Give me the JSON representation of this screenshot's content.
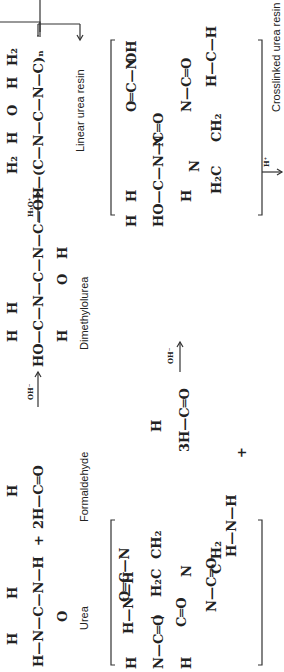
{
  "diagram": {
    "orientation": "rotated 90deg counterclockwise",
    "row1": {
      "urea": {
        "label": "Urea",
        "top": [
          "H",
          "H"
        ],
        "chain": "H—N—C—N—H",
        "bottom": "O"
      },
      "plus": "+",
      "formaldehyde": {
        "label": "Formaldehyde",
        "top": "H",
        "chain": "2H—C═O"
      },
      "arrow1_condition": "OH⁻",
      "dimethylolurea": {
        "label": "Dimethylolurea",
        "top": [
          "H",
          "H"
        ],
        "chain": "HO—C—N—C—N—C—OH",
        "bottom": [
          "H",
          "O",
          "H",
          "H"
        ]
      },
      "arrow2_condition": "H₃O⁺",
      "linear_resin": {
        "label": "Linear urea resin",
        "top": [
          "H₂",
          "H",
          "O",
          "H",
          "H₂"
        ],
        "chain": "—(C—N—C—N—C)ₙ"
      }
    },
    "row2": {
      "reactant_cyclic": {
        "pieces": [
          "H—N—C═O",
          "H—N—H",
          "O═C—N",
          "H₂C",
          "CH₂",
          "C H₂",
          "N—C═O",
          "H—N—H"
        ]
      },
      "plus": "+",
      "formaldehyde": {
        "top": "H",
        "chain": "3H—C═O"
      },
      "arrow_condition": "OH⁻",
      "product_cyclic": {
        "pieces": [
          "HO—C—N—C═O",
          "H H",
          "O═C—N",
          "CH₂",
          "H₂C",
          "C H₂",
          "OH"
        ]
      },
      "arrow_down_condition": "H⁺"
    },
    "bottom_text_cut": "Crosslinked urea resin"
  }
}
